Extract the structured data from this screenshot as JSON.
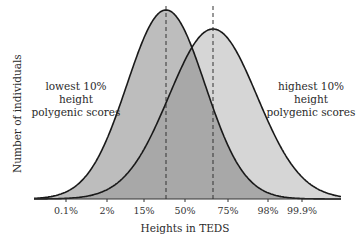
{
  "chart_data": {
    "type": "area",
    "title": "",
    "xlabel": "Heights in TEDS",
    "ylabel": "Number of individuals",
    "x_tick_labels": [
      "0.1%",
      "2%",
      "15%",
      "50%",
      "75%",
      "98%",
      "99.9%"
    ],
    "x_tick_px": [
      66,
      107,
      144,
      185,
      228,
      268,
      302
    ],
    "grid": false,
    "legend": "none (inline annotations)",
    "series": [
      {
        "name": "lowest 10% height polygenic scores",
        "shape": "normal distribution",
        "mean_px": 166,
        "peak_y_px": 10,
        "sd_px": 39,
        "fill": "#bdbdbd",
        "mean_marker": "dashed vertical line"
      },
      {
        "name": "highest 10% height polygenic scores",
        "shape": "normal distribution",
        "mean_px": 213,
        "peak_y_px": 29,
        "sd_px": 44,
        "fill": "#d6d6d6",
        "mean_marker": "dashed vertical line"
      }
    ],
    "overlap_fill": "#a8a8a8",
    "annotations": [
      {
        "text": "lowest 10% height\npolygenic scores",
        "position": "left of left curve"
      },
      {
        "text": "highest 10% height\npolygenic scores",
        "position": "right of right curve"
      }
    ]
  },
  "labels": {
    "left_line1": "lowest 10% height",
    "left_line2": "polygenic scores",
    "right_line1": "highest 10% height",
    "right_line2": "polygenic scores",
    "xlabel": "Heights in TEDS",
    "ylabel": "Number of individuals",
    "ticks": [
      "0.1%",
      "2%",
      "15%",
      "50%",
      "75%",
      "98%",
      "99.9%"
    ]
  },
  "colors": {
    "left_fill": "#bdbdbd",
    "right_fill": "#d6d6d6",
    "overlap_fill": "#a8a8a8",
    "stroke": "#1a1a1a"
  }
}
